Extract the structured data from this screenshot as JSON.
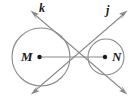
{
  "figure": {
    "background_color": "#ffffff",
    "stroke_color": "#8a8a8a",
    "label_color": "#1a1a1a",
    "width": 136,
    "height": 101,
    "circles": [
      {
        "name": "circle-M",
        "label": "M",
        "center_x": 41,
        "center_y": 57,
        "radius": 29
      },
      {
        "name": "circle-N",
        "label": "N",
        "center_x": 106,
        "center_y": 57,
        "radius": 18
      }
    ],
    "points": [
      {
        "name": "center-point-M",
        "label": "M",
        "x": 41,
        "y": 57
      },
      {
        "name": "center-point-N",
        "label": "N",
        "x": 106,
        "y": 57
      },
      {
        "name": "intersection-point",
        "label": "",
        "x": 80,
        "y": 57
      }
    ],
    "segments": [
      {
        "name": "segment-MN",
        "label": "",
        "x1": 41,
        "y1": 57,
        "x2": 106,
        "y2": 57
      }
    ],
    "lines": [
      {
        "name": "line-k",
        "label": "k",
        "x1": 32,
        "y1": 12,
        "x2": 126,
        "y2": 93,
        "arrow_start": true,
        "arrow_end": true,
        "label_x": 39,
        "label_y": 2
      },
      {
        "name": "line-j",
        "label": "j",
        "x1": 126,
        "y1": 12,
        "x2": 32,
        "y2": 93,
        "arrow_start": true,
        "arrow_end": true,
        "label_x": 106,
        "label_y": 4
      }
    ]
  }
}
